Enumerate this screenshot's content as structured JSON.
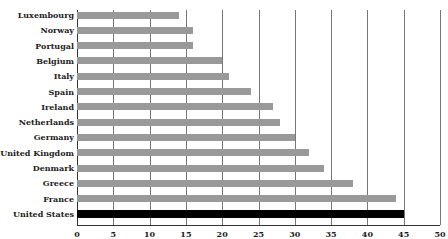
{
  "chart_data": {
    "type": "bar",
    "orientation": "horizontal",
    "title": "",
    "xlabel": "",
    "ylabel": "",
    "xlim": [
      0,
      50
    ],
    "grid": true,
    "categories": [
      "Luxembourg",
      "Norway",
      "Portugal",
      "Belgium",
      "Italy",
      "Spain",
      "Ireland",
      "Netherlands",
      "Germany",
      "United Kingdom",
      "Denmark",
      "Greece",
      "France",
      "United States"
    ],
    "values": [
      14,
      16,
      16,
      20,
      21,
      24,
      27,
      28,
      30,
      32,
      34,
      38,
      44,
      45
    ],
    "highlight": "United States",
    "colors": {
      "bar": "#999999",
      "highlight": "#000000",
      "grid": "#777777"
    },
    "x_ticks": [
      "0",
      "5",
      "10",
      "15",
      "20",
      "25",
      "30",
      "35",
      "40",
      "45",
      "50"
    ]
  }
}
